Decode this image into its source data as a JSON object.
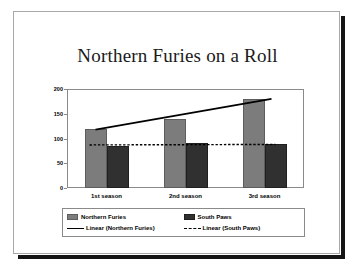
{
  "slide": {
    "title": "Northern Furies on a Roll"
  },
  "chart_data": {
    "type": "bar",
    "title": "Northern Furies on a Roll",
    "xlabel": "",
    "ylabel": "",
    "categories": [
      "1st season",
      "2nd season",
      "3rd season"
    ],
    "series": [
      {
        "name": "Northern Furies",
        "values": [
          120,
          140,
          180
        ],
        "color": "#7c7c7c"
      },
      {
        "name": "South Paws",
        "values": [
          85,
          90,
          88
        ],
        "color": "#303030"
      }
    ],
    "trendlines": [
      {
        "name": "Linear (Northern Furies)",
        "style": "solid",
        "start": 118,
        "end": 180,
        "color": "#000000"
      },
      {
        "name": "Linear (South Paws)",
        "style": "dotted",
        "start": 87,
        "end": 88,
        "color": "#000000"
      }
    ],
    "ylim": [
      0,
      200
    ],
    "yticks": [
      0,
      50,
      100,
      150,
      200
    ],
    "ytick_labels": [
      "0",
      "50",
      "100",
      "150",
      "200"
    ],
    "grid": false,
    "legend_position": "bottom"
  },
  "legend": {
    "entries": [
      {
        "label": "Northern Furies",
        "key": "swatch-light"
      },
      {
        "label": "South Paws",
        "key": "swatch-dark"
      },
      {
        "label": "Linear (Northern Furies)",
        "key": "line-solid"
      },
      {
        "label": "Linear (South Paws)",
        "key": "line-dotted"
      }
    ]
  }
}
